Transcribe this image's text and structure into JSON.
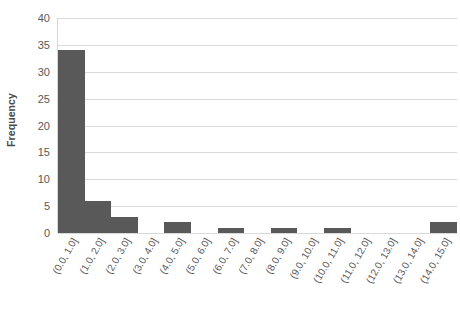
{
  "chart_data": {
    "type": "bar",
    "title": "",
    "subtitle": "",
    "xlabel": "",
    "ylabel": "Frequency",
    "categories": [
      "(0.0, 1.0]",
      "(1.0, 2.0]",
      "(2.0, 3.0]",
      "(3.0, 4.0]",
      "(4.0, 5.0]",
      "(5.0, 6.0]",
      "(6.0, 7.0]",
      "(7.0, 8.0]",
      "(8.0, 9.0]",
      "(9.0, 10.0]",
      "(10.0, 11.0]",
      "(11.0, 12.0]",
      "(12.0, 13.0]",
      "(13.0, 14.0]",
      "(14.0, 15.0]"
    ],
    "values": [
      34,
      6,
      3,
      0,
      2,
      0,
      1,
      0,
      1,
      0,
      1,
      0,
      0,
      0,
      2
    ],
    "ylim": [
      0,
      40
    ],
    "ytick_values": [
      0,
      5,
      10,
      15,
      20,
      25,
      30,
      35,
      40
    ],
    "ytick_labels": [
      "0",
      "5",
      "10",
      "15",
      "20",
      "25",
      "30",
      "35",
      "40"
    ],
    "grid": "horizontal",
    "legend": "none",
    "bar_color": "#595959",
    "gridline_color": "#d9d9d9",
    "axis_color": "#d6d6d6",
    "text_color": "#595959",
    "background": "#ffffff",
    "xlabel_rotation_degrees": -60
  }
}
